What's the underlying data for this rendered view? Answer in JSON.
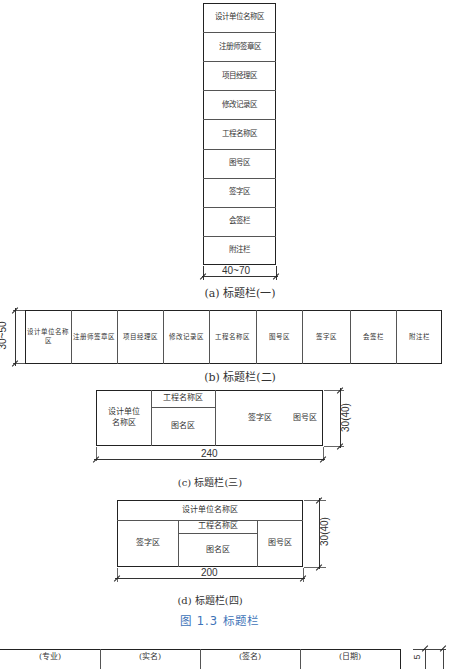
{
  "figure_caption": "图 1.3   标题栏",
  "panel_a": {
    "caption": "(a) 标题栏(一)",
    "cells": [
      "设计单位名称区",
      "注册师签章区",
      "项目经理区",
      "修改记录区",
      "工程名称区",
      "图号区",
      "签字区",
      "会签栏",
      "附注栏"
    ],
    "width_dim": "40~70"
  },
  "panel_b": {
    "caption": "(b) 标题栏(二)",
    "cells": [
      "设计单位名称区",
      "注册师签章区",
      "项目经理区",
      "修改记录区",
      "工程名称区",
      "图号区",
      "签字区",
      "会签栏",
      "附注栏"
    ],
    "height_dim": "30~50"
  },
  "panel_c": {
    "caption": "(c) 标题栏(三)",
    "design_unit": "设计单位\n名称区",
    "project_name": "工程名称区",
    "drawing_name": "图名区",
    "signature": "签字区",
    "drawing_no": "图号区",
    "width_dim": "240",
    "height_dim": "30(40)"
  },
  "panel_d": {
    "caption": "(d) 标题栏(四)",
    "design_unit": "设计单位名称区",
    "signature": "签字区",
    "project_name": "工程名称区",
    "drawing_name": "图名区",
    "drawing_no": "图号区",
    "width_dim": "200",
    "height_dim": "30(40)"
  },
  "countersign_table": {
    "headers": [
      "(专业)",
      "(实名)",
      "(签名)",
      "(日期)"
    ],
    "height_dim": "5"
  },
  "colors": {
    "line": "#222222",
    "caption_blue": "#3d73b8"
  }
}
